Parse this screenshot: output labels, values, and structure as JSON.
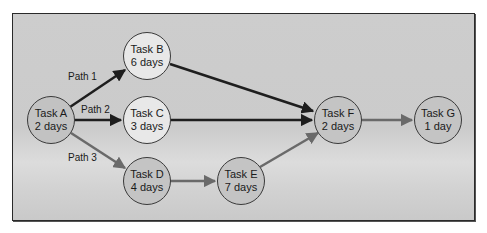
{
  "diagram": {
    "type": "network-diagram",
    "colors": {
      "background": "#cdcdcd",
      "frame_border": "#2a2a2a",
      "node_fill_dark": "#c2c2c2",
      "node_fill_light": "#e8e8e8",
      "node_stroke": "#3a3a3a",
      "critical_arrow": "#1e1e1e",
      "other_arrow": "#6a6a6a"
    },
    "nodes": [
      {
        "id": "A",
        "name": "Task A",
        "duration": "2 days"
      },
      {
        "id": "B",
        "name": "Task B",
        "duration": "6 days"
      },
      {
        "id": "C",
        "name": "Task C",
        "duration": "3 days"
      },
      {
        "id": "D",
        "name": "Task D",
        "duration": "4 days"
      },
      {
        "id": "E",
        "name": "Task E",
        "duration": "7 days"
      },
      {
        "id": "F",
        "name": "Task F",
        "duration": "2 days"
      },
      {
        "id": "G",
        "name": "Task G",
        "duration": "1 day"
      }
    ],
    "paths": [
      {
        "label": "Path 1",
        "sequence": [
          "A",
          "B",
          "F"
        ]
      },
      {
        "label": "Path 2",
        "sequence": [
          "A",
          "C",
          "F"
        ]
      },
      {
        "label": "Path 3",
        "sequence": [
          "A",
          "D",
          "E",
          "F"
        ]
      }
    ],
    "edges": [
      {
        "from": "A",
        "to": "B",
        "style": "dark"
      },
      {
        "from": "A",
        "to": "C",
        "style": "dark"
      },
      {
        "from": "A",
        "to": "D",
        "style": "gray"
      },
      {
        "from": "B",
        "to": "F",
        "style": "dark"
      },
      {
        "from": "C",
        "to": "F",
        "style": "dark"
      },
      {
        "from": "D",
        "to": "E",
        "style": "gray"
      },
      {
        "from": "E",
        "to": "F",
        "style": "gray"
      },
      {
        "from": "F",
        "to": "G",
        "style": "gray"
      }
    ]
  }
}
